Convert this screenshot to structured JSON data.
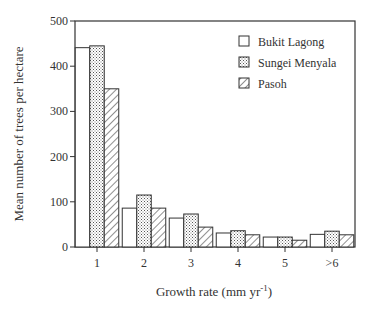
{
  "chart_data": {
    "type": "bar",
    "title": "",
    "xlabel": "Growth rate (mm yr",
    "xlabel_sup": "-1",
    "xlabel_close": ")",
    "ylabel": "Mean number of trees per hectare",
    "ylim": [
      0,
      500
    ],
    "yticks": [
      0,
      100,
      200,
      300,
      400,
      500
    ],
    "categories": [
      "1",
      "2",
      "3",
      "4",
      "5",
      ">6"
    ],
    "series": [
      {
        "name": "Bukit Lagong",
        "pattern": "open",
        "values": [
          441,
          86,
          64,
          31,
          22,
          28
        ]
      },
      {
        "name": "Sungei Menyala",
        "pattern": "stippled",
        "values": [
          445,
          115,
          73,
          36,
          22,
          35
        ]
      },
      {
        "name": "Pasoh",
        "pattern": "hatched",
        "values": [
          350,
          86,
          44,
          27,
          15,
          27
        ]
      }
    ],
    "legend_position": "top-right",
    "grid": false
  }
}
